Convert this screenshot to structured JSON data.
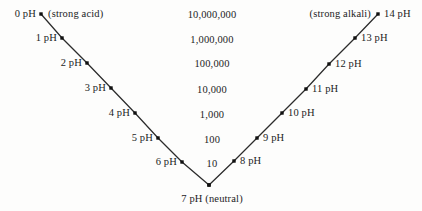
{
  "chart_data": {
    "type": "line",
    "title": "",
    "xlabel": "",
    "ylabel": "",
    "grid": false,
    "legend": null,
    "categories": [
      "0 pH",
      "1 pH",
      "2 pH",
      "3 pH",
      "4 pH",
      "5 pH",
      "6 pH",
      "7 pH",
      "8 pH",
      "9 pH",
      "10 pH",
      "11 pH",
      "12 pH",
      "13 pH",
      "14 pH"
    ],
    "center_values": [
      "10,000,000",
      "1,000,000",
      "100,000",
      "10,000",
      "1,000",
      "100",
      "10"
    ],
    "series": [
      {
        "name": "acid-arm",
        "points": [
          {
            "label": "0 pH",
            "x": 41,
            "y": 14
          },
          {
            "label": "1 pH",
            "x": 62,
            "y": 38
          },
          {
            "label": "2 pH",
            "x": 87,
            "y": 63
          },
          {
            "label": "3 pH",
            "x": 111,
            "y": 88
          },
          {
            "label": "4 pH",
            "x": 135,
            "y": 113
          },
          {
            "label": "5 pH",
            "x": 158,
            "y": 138
          },
          {
            "label": "6 pH",
            "x": 182,
            "y": 162
          },
          {
            "label": "7 pH",
            "x": 209,
            "y": 185
          }
        ]
      },
      {
        "name": "alkali-arm",
        "points": [
          {
            "label": "7 pH",
            "x": 209,
            "y": 185
          },
          {
            "label": "8 pH",
            "x": 234,
            "y": 161
          },
          {
            "label": "9 pH",
            "x": 257,
            "y": 138
          },
          {
            "label": "10 pH",
            "x": 282,
            "y": 113
          },
          {
            "label": "11 pH",
            "x": 306,
            "y": 89
          },
          {
            "label": "12 pH",
            "x": 329,
            "y": 64
          },
          {
            "label": "13 pH",
            "x": 355,
            "y": 38
          },
          {
            "label": "14 pH",
            "x": 378,
            "y": 14
          }
        ]
      }
    ]
  },
  "style": {
    "line_color": "#2b2b2b",
    "dot_color": "#111111",
    "text_color": "#1c1c1c",
    "background": "#fdfdfc"
  },
  "annotations": {
    "strong_acid": "(strong acid)",
    "strong_alkali": "(strong alkali)",
    "neutral": "7 pH (neutral)"
  },
  "acid_labels": [
    {
      "text": "0 pH",
      "x": 36,
      "y": 14
    },
    {
      "text": "1 pH",
      "x": 57,
      "y": 38
    },
    {
      "text": "2 pH",
      "x": 82,
      "y": 63
    },
    {
      "text": "3 pH",
      "x": 106,
      "y": 88
    },
    {
      "text": "4 pH",
      "x": 130,
      "y": 113
    },
    {
      "text": "5 pH",
      "x": 153,
      "y": 138
    },
    {
      "text": "6 pH",
      "x": 177,
      "y": 162
    }
  ],
  "alkali_labels": [
    {
      "text": "8 pH",
      "x": 240,
      "y": 161
    },
    {
      "text": "9 pH",
      "x": 263,
      "y": 138
    },
    {
      "text": "10 pH",
      "x": 288,
      "y": 113
    },
    {
      "text": "11 pH",
      "x": 312,
      "y": 89
    },
    {
      "text": "12 pH",
      "x": 335,
      "y": 64
    },
    {
      "text": "13 pH",
      "x": 361,
      "y": 38
    },
    {
      "text": "14 pH",
      "x": 384,
      "y": 14
    }
  ],
  "center_labels": [
    {
      "text": "10,000,000",
      "x": 212,
      "y": 15
    },
    {
      "text": "1,000,000",
      "x": 212,
      "y": 40
    },
    {
      "text": "100,000",
      "x": 212,
      "y": 64
    },
    {
      "text": "10,000",
      "x": 212,
      "y": 90
    },
    {
      "text": "1,000",
      "x": 212,
      "y": 115
    },
    {
      "text": "100",
      "x": 212,
      "y": 140
    },
    {
      "text": "10",
      "x": 212,
      "y": 164
    }
  ],
  "side_notes": [
    {
      "name": "strong-acid-note",
      "text": "(strong acid)",
      "x": 48,
      "y": 14,
      "align": "left"
    },
    {
      "name": "strong-alkali-note",
      "text": "(strong alkali)",
      "x": 371,
      "y": 14,
      "align": "right"
    }
  ],
  "neutral_label": {
    "text": "7 pH (neutral)",
    "x": 212,
    "y": 199
  }
}
